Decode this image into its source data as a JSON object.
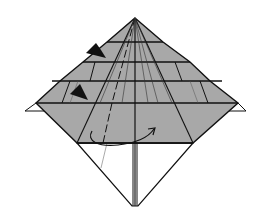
{
  "diagram": {
    "type": "origami-folding-step",
    "colors": {
      "paper_gray": "#a8a8a8",
      "paper_white": "#ffffff",
      "line": "#111111"
    },
    "symbols": [
      {
        "name": "push-arrow-upper",
        "kind": "solid-arrowhead"
      },
      {
        "name": "push-arrow-lower",
        "kind": "solid-arrowhead"
      },
      {
        "name": "turn-over-arrow",
        "kind": "curved-arrow"
      }
    ],
    "caption": "Origami fold diagram"
  }
}
